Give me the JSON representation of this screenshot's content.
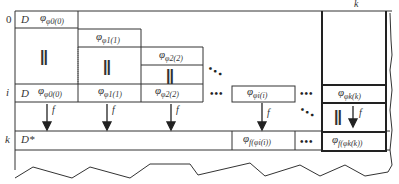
{
  "diagram": {
    "row_labels": {
      "row0": "0",
      "rowi": "i",
      "rowk": "k"
    },
    "column_labels": {
      "colk": "k"
    },
    "row0": {
      "d_label": "D",
      "phi": "φ",
      "phi_sub": "φ",
      "phi_subsub": "0(0)"
    },
    "rowi": {
      "d_label": "D",
      "cells": [
        {
          "phi": "φ",
          "sub": "φ",
          "subsub": "0(0)"
        },
        {
          "phi": "φ",
          "sub": "φ",
          "subsub": "1(1)"
        },
        {
          "phi": "φ",
          "sub": "φ",
          "subsub": "2(2)"
        },
        {
          "phi": "φ",
          "sub": "φ",
          "subsub": "i(i)"
        },
        {
          "phi": "φ",
          "sub": "φ",
          "subsub": "k(k)"
        }
      ]
    },
    "stair": [
      {
        "phi": "φ",
        "sub": "φ",
        "subsub": "1(1)"
      },
      {
        "phi": "φ",
        "sub": "φ",
        "subsub": "2(2)"
      }
    ],
    "equals_symbol": "||",
    "ellipsis": "•••",
    "diag_ellipsis": "⋱",
    "arrow_label": "f",
    "rowk": {
      "d_label": "D*",
      "cells": [
        {
          "phi": "φ",
          "sub": "f(φ",
          "subsub": "i(i))"
        },
        {
          "phi": "φ",
          "sub": "f(φ",
          "subsub": "k(k))"
        }
      ]
    }
  }
}
